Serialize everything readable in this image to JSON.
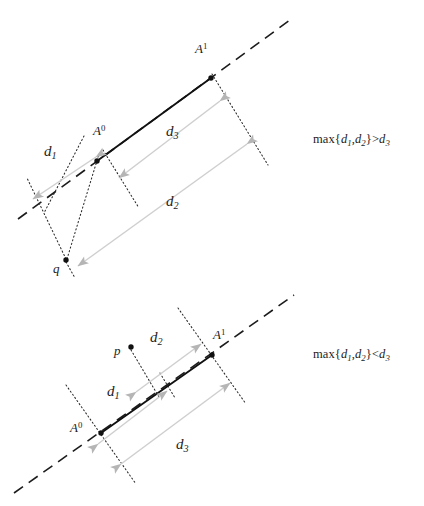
{
  "figure": {
    "background_color": "#ffffff",
    "ink_color": "#1c1c1c",
    "arrow_color": "#b9b9b9",
    "dotted_color": "#3a3a3a",
    "segment_color": "#111111"
  },
  "panels": [
    {
      "id": "top-panel",
      "condition": "max{d1,d2}>d3",
      "condition_parts": {
        "func": "max{",
        "d1": "d",
        "d1_sub": "1",
        "comma": ",",
        "d2": "d",
        "d2_sub": "2",
        "close": "}",
        "relation": ">",
        "d3": "d",
        "d3_sub": "3"
      },
      "points": [
        {
          "name": "A0",
          "base": "A",
          "exponent": "0",
          "x": 97,
          "y": 161,
          "label_x": 94,
          "label_y": 128
        },
        {
          "name": "A1",
          "base": "A",
          "exponent": "1",
          "x": 211,
          "y": 78,
          "label_x": 196,
          "label_y": 46
        },
        {
          "name": "q",
          "base": "q",
          "exponent": "",
          "x": 66,
          "y": 261,
          "label_x": 55,
          "label_y": 264
        }
      ],
      "distance_labels": [
        {
          "name": "d1",
          "base": "d",
          "subscript": "1",
          "label_x": 46,
          "label_y": 146
        },
        {
          "name": "d2",
          "base": "d",
          "subscript": "2",
          "label_x": 168,
          "label_y": 196
        },
        {
          "name": "d3",
          "base": "d",
          "subscript": "3",
          "label_x": 168,
          "label_y": 126
        }
      ],
      "condition_pos": {
        "x": 313,
        "y": 132
      }
    },
    {
      "id": "bottom-panel",
      "condition": "max{d1,d2}<d3",
      "condition_parts": {
        "func": "max{",
        "d1": "d",
        "d1_sub": "1",
        "comma": ",",
        "d2": "d",
        "d2_sub": "2",
        "close": "}",
        "relation": "<",
        "d3": "d",
        "d3_sub": "3"
      },
      "points": [
        {
          "name": "A0",
          "base": "A",
          "exponent": "0",
          "x": 101,
          "y": 433,
          "label_x": 71,
          "label_y": 425
        },
        {
          "name": "A1",
          "base": "A",
          "exponent": "1",
          "x": 212,
          "y": 355,
          "label_x": 213,
          "label_y": 332
        },
        {
          "name": "p",
          "base": "p",
          "exponent": "",
          "x": 131,
          "y": 347,
          "label_x": 116,
          "label_y": 348
        }
      ],
      "distance_labels": [
        {
          "name": "d1",
          "base": "d",
          "subscript": "1",
          "label_x": 110,
          "label_y": 388
        },
        {
          "name": "d2",
          "base": "d",
          "subscript": "2",
          "label_x": 152,
          "label_y": 334
        },
        {
          "name": "d3",
          "base": "d",
          "subscript": "3",
          "label_x": 178,
          "label_y": 440
        }
      ],
      "condition_pos": {
        "x": 313,
        "y": 347
      }
    }
  ],
  "geometry": {
    "top": {
      "dashed_line": {
        "x1": 18,
        "y1": 219,
        "x2": 290,
        "y2": 20
      },
      "solid_segment": {
        "x1": 97,
        "y1": 161,
        "x2": 211,
        "y2": 78
      },
      "arrow_d1": {
        "x1": 96,
        "y1": 157,
        "x2": 33,
        "y2": 199
      },
      "arrow_d3": {
        "x1": 219,
        "y1": 101,
        "x2": 119,
        "y2": 177
      },
      "arrow_d2": {
        "x1": 246,
        "y1": 145,
        "x2": 78,
        "y2": 266
      },
      "dotted_perp_A1": {
        "x1": 212,
        "y1": 75,
        "x2": 258,
        "y2": 150
      },
      "dotted_perp_A0_left": {
        "x1": 85,
        "y1": 138,
        "x2": 45,
        "y2": 211
      },
      "dotted_perp_A0_right": {
        "x1": 104,
        "y1": 152,
        "x2": 133,
        "y2": 198
      },
      "dotted_q_to_A0": {
        "x1": 66,
        "y1": 261,
        "x2": 99,
        "y2": 155
      },
      "dotted_q_to_left": {
        "x1": 66,
        "y1": 261,
        "x2": 28,
        "y2": 180
      },
      "dotted_tail_1": {
        "x1": 258,
        "y1": 150,
        "x2": 266,
        "y2": 162
      },
      "dotted_tail_2": {
        "x1": 133,
        "y1": 198,
        "x2": 137,
        "y2": 206
      }
    },
    "bottom": {
      "dashed_line": {
        "x1": 14,
        "y1": 493,
        "x2": 294,
        "y2": 295
      },
      "solid_segment": {
        "x1": 101,
        "y1": 433,
        "x2": 212,
        "y2": 355
      },
      "arrow_d1": {
        "x1": 99,
        "y1": 443,
        "x2": 166,
        "y2": 392
      },
      "arrow_d2": {
        "x1": 137,
        "y1": 391,
        "x2": 200,
        "y2": 345
      },
      "arrow_d3": {
        "x1": 122,
        "y1": 463,
        "x2": 229,
        "y2": 384
      },
      "dotted_perp_A0_up": {
        "x1": 68,
        "y1": 388,
        "x2": 101,
        "y2": 433
      },
      "dotted_perp_A0_down": {
        "x1": 101,
        "y1": 433,
        "x2": 133,
        "y2": 481
      },
      "dotted_perp_A1_up": {
        "x1": 180,
        "y1": 311,
        "x2": 212,
        "y2": 355
      },
      "dotted_perp_A1_down": {
        "x1": 212,
        "y1": 355,
        "x2": 243,
        "y2": 400
      },
      "dotted_p_down": {
        "x1": 131,
        "y1": 349,
        "x2": 156,
        "y2": 392
      },
      "dotted_short_d1_end": {
        "x1": 158,
        "y1": 375,
        "x2": 172,
        "y2": 397
      }
    }
  }
}
